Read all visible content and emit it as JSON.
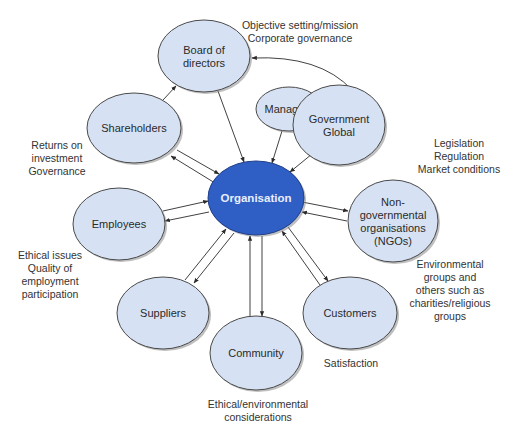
{
  "diagram": {
    "colors": {
      "node_fill": "#d6e2f3",
      "node_stroke": "#4a4a4a",
      "center_fill": "#2f5fc4",
      "center_stroke": "#1f3f8a",
      "shadow": "#8a8a8a",
      "edge": "#2b2b2b",
      "text": "#2a2a2a"
    },
    "nodes": [
      {
        "id": "organisation",
        "lines": [
          "Organisation"
        ],
        "cx": 256,
        "cy": 198,
        "rx": 48,
        "ry": 37,
        "center": true
      },
      {
        "id": "board",
        "lines": [
          "Board of",
          "directors"
        ],
        "cx": 204,
        "cy": 56,
        "rx": 46,
        "ry": 36
      },
      {
        "id": "managers",
        "lines": [
          "Managers"
        ],
        "cx": 289,
        "cy": 109,
        "rx": 33,
        "ry": 22
      },
      {
        "id": "government",
        "lines": [
          "Government",
          "Global"
        ],
        "cx": 339,
        "cy": 125,
        "rx": 46,
        "ry": 40
      },
      {
        "id": "shareholders",
        "lines": [
          "Shareholders"
        ],
        "cx": 134,
        "cy": 128,
        "rx": 47,
        "ry": 35
      },
      {
        "id": "employees",
        "lines": [
          "Employees"
        ],
        "cx": 119,
        "cy": 224,
        "rx": 46,
        "ry": 36
      },
      {
        "id": "ngos",
        "lines": [
          "Non-",
          "governmental",
          "organisations",
          "(NGOs)"
        ],
        "cx": 393,
        "cy": 221,
        "rx": 45,
        "ry": 41
      },
      {
        "id": "suppliers",
        "lines": [
          "Suppliers"
        ],
        "cx": 163,
        "cy": 313,
        "rx": 46,
        "ry": 36
      },
      {
        "id": "customers",
        "lines": [
          "Customers"
        ],
        "cx": 350,
        "cy": 313,
        "rx": 47,
        "ry": 36
      },
      {
        "id": "community",
        "lines": [
          "Community"
        ],
        "cx": 256,
        "cy": 353,
        "rx": 46,
        "ry": 37
      }
    ],
    "edges": [
      {
        "from": "shareholders",
        "to": "board",
        "x1": 163,
        "y1": 100,
        "x2": 176,
        "y2": 86,
        "arrow_end": true
      },
      {
        "from": "board",
        "to": "organisation",
        "x1": 218,
        "y1": 91,
        "x2": 244,
        "y2": 162,
        "arrow_end": true
      },
      {
        "from": "managers",
        "to": "organisation",
        "x1": 282,
        "y1": 131,
        "x2": 272,
        "y2": 163,
        "arrow_end": true
      },
      {
        "from": "government",
        "to": "organisation",
        "x1": 312,
        "y1": 154,
        "x2": 290,
        "y2": 172,
        "arrow_end": true
      },
      {
        "from": "shareholders",
        "to": "organisation",
        "x1": 177,
        "y1": 150,
        "x2": 219,
        "y2": 174,
        "arrow_end": true
      },
      {
        "from": "organisation",
        "to": "shareholders",
        "x1": 215,
        "y1": 183,
        "x2": 171,
        "y2": 156,
        "arrow_end": true
      },
      {
        "from": "employees",
        "to": "organisation",
        "x1": 163,
        "y1": 211,
        "x2": 208,
        "y2": 201,
        "arrow_end": true
      },
      {
        "from": "organisation",
        "to": "employees",
        "x1": 209,
        "y1": 212,
        "x2": 165,
        "y2": 221,
        "arrow_end": true
      },
      {
        "from": "organisation",
        "to": "ngos",
        "x1": 302,
        "y1": 202,
        "x2": 348,
        "y2": 211,
        "arrow_end": true
      },
      {
        "from": "ngos",
        "to": "organisation",
        "x1": 347,
        "y1": 221,
        "x2": 302,
        "y2": 212,
        "arrow_end": true
      },
      {
        "from": "suppliers",
        "to": "organisation",
        "x1": 185,
        "y1": 280,
        "x2": 226,
        "y2": 229,
        "arrow_end": true
      },
      {
        "from": "organisation",
        "to": "suppliers",
        "x1": 234,
        "y1": 233,
        "x2": 194,
        "y2": 283,
        "arrow_end": true
      },
      {
        "from": "community",
        "to": "organisation",
        "x1": 250,
        "y1": 316,
        "x2": 250,
        "y2": 236,
        "arrow_end": true
      },
      {
        "from": "organisation",
        "to": "community",
        "x1": 262,
        "y1": 236,
        "x2": 262,
        "y2": 316,
        "arrow_end": true
      },
      {
        "from": "customers",
        "to": "organisation",
        "x1": 320,
        "y1": 285,
        "x2": 282,
        "y2": 231,
        "arrow_end": true
      },
      {
        "from": "organisation",
        "to": "customers",
        "x1": 288,
        "y1": 227,
        "x2": 328,
        "y2": 281,
        "arrow_end": true
      }
    ],
    "curved_edges": [
      {
        "from": "government",
        "to": "board",
        "d": "M 352 90 Q 320 55 252 58",
        "arrow_end": true
      }
    ],
    "annotations": [
      {
        "id": "board-annotation",
        "lines": [
          "Objective setting/mission",
          "Corporate governance"
        ],
        "x": 300,
        "y": 29,
        "anchor": "middle"
      },
      {
        "id": "shareholders-annotation",
        "lines": [
          "Returns on",
          "investment",
          "Governance"
        ],
        "x": 57,
        "y": 149,
        "anchor": "middle"
      },
      {
        "id": "government-annotation",
        "lines": [
          "Legislation",
          "Regulation",
          "Market conditions"
        ],
        "x": 459,
        "y": 147,
        "anchor": "middle"
      },
      {
        "id": "employees-annotation",
        "lines": [
          "Ethical issues",
          "Quality of",
          "employment",
          "participation"
        ],
        "x": 50,
        "y": 259,
        "anchor": "middle"
      },
      {
        "id": "ngos-annotation",
        "lines": [
          "Environmental",
          "groups and",
          "others such as",
          "charities/religious",
          "groups"
        ],
        "x": 450,
        "y": 268,
        "anchor": "middle"
      },
      {
        "id": "customers-annotation",
        "lines": [
          "Satisfaction"
        ],
        "x": 351,
        "y": 367,
        "anchor": "middle"
      },
      {
        "id": "community-annotation",
        "lines": [
          "Ethical/environmental",
          "considerations"
        ],
        "x": 258,
        "y": 408,
        "anchor": "middle"
      }
    ]
  }
}
